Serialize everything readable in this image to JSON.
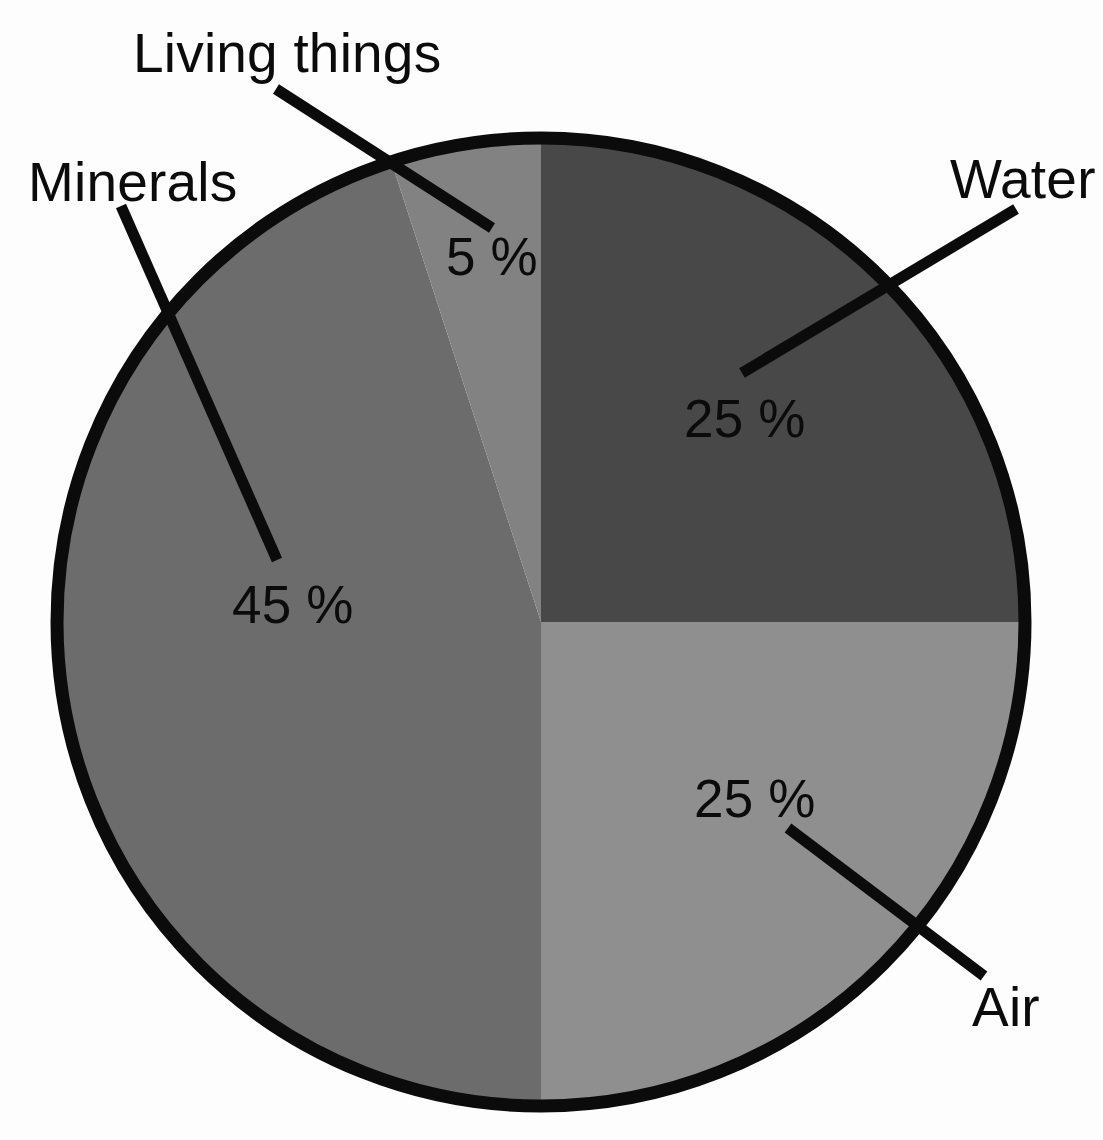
{
  "chart_data": {
    "type": "pie",
    "title": "",
    "subtitle": "",
    "xlabel": "",
    "ylabel": "",
    "legend_position": "callout-labels",
    "grid": false,
    "units": "%",
    "total": 100,
    "start_angle_deg": 0,
    "direction": "clockwise",
    "categories": [
      "Water",
      "Air",
      "Minerals",
      "Living things"
    ],
    "values": [
      25,
      25,
      45,
      5
    ],
    "slices": [
      {
        "name": "Water",
        "label": "Water",
        "value": 25,
        "value_text": "25 %",
        "color": "#484848",
        "start_deg": 0,
        "end_deg": 90
      },
      {
        "name": "Air",
        "label": "Air",
        "value": 25,
        "value_text": "25 %",
        "color": "#8f8f8f",
        "start_deg": 90,
        "end_deg": 180
      },
      {
        "name": "Minerals",
        "label": "Minerals",
        "value": 45,
        "value_text": "45 %",
        "color": "#6c6c6c",
        "start_deg": 180,
        "end_deg": 342
      },
      {
        "name": "Living things",
        "label": "Living things",
        "value": 5,
        "value_text": "5 %",
        "color": "#828282",
        "start_deg": 342,
        "end_deg": 360
      }
    ],
    "outline_color": "#0b0b0b",
    "background_color": "#fdfdfd",
    "text_color": "#0b0b0b"
  },
  "labels": {
    "living_things": "Living things",
    "minerals": "Minerals",
    "water": "Water",
    "air": "Air"
  },
  "percentages": {
    "living_things": "5 %",
    "water": "25 %",
    "minerals": "45 %",
    "air": "25 %"
  }
}
